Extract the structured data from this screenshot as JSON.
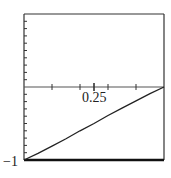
{
  "chart_data": {
    "type": "line",
    "title": "",
    "xlabel": "",
    "ylabel": "",
    "xlim": [
      0,
      0.5
    ],
    "ylim": [
      -1,
      1
    ],
    "grid": false,
    "legend": null,
    "x_tick_labels": [
      "0.25"
    ],
    "y_tick_labels": [
      "-1"
    ],
    "x_minor_ticks": [
      0.1,
      0.2,
      0.25,
      0.3,
      0.4
    ],
    "y_tick_step": 0.1,
    "series": [
      {
        "name": "curve",
        "x": [
          0,
          0.05,
          0.1,
          0.15,
          0.2,
          0.25,
          0.3,
          0.35,
          0.4,
          0.45,
          0.5
        ],
        "y": [
          -1,
          -0.91,
          -0.81,
          -0.71,
          -0.6,
          -0.5,
          -0.39,
          -0.29,
          -0.19,
          -0.09,
          0
        ]
      }
    ],
    "colors": {
      "frame": "#333333",
      "line": "#222222"
    }
  },
  "labels": {
    "x_tick": "0.25",
    "y_min": "−1"
  }
}
